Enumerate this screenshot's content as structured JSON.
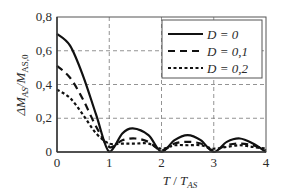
{
  "chart_data": {
    "type": "line",
    "title": "",
    "xlabel": "T / T_AS",
    "ylabel": "ΔM_AS / M_AS,0",
    "xlim": [
      0,
      4
    ],
    "ylim": [
      0,
      0.8
    ],
    "x_ticks": [
      "0",
      "1",
      "2",
      "3",
      "4"
    ],
    "y_ticks": [
      "0",
      "0,2",
      "0,4",
      "0,6",
      "0,8"
    ],
    "grid": true,
    "legend_position": "upper right",
    "series": [
      {
        "name": "D = 0",
        "style": "solid",
        "x": [
          0,
          0.25,
          0.5,
          0.75,
          1.0,
          1.25,
          1.45,
          1.75,
          2.0,
          2.25,
          2.5,
          2.75,
          3.0,
          3.25,
          3.5,
          3.75,
          4.0
        ],
        "y": [
          0.7,
          0.63,
          0.45,
          0.22,
          0.0,
          0.11,
          0.14,
          0.1,
          0.0,
          0.07,
          0.1,
          0.07,
          0.0,
          0.06,
          0.08,
          0.05,
          0.0
        ]
      },
      {
        "name": "D = 0,1",
        "style": "dashed",
        "x": [
          0,
          0.25,
          0.5,
          0.75,
          1.0,
          1.25,
          1.5,
          1.75,
          2.0,
          2.25,
          2.5,
          2.75,
          3.0,
          3.25,
          3.5,
          3.75,
          4.0
        ],
        "y": [
          0.51,
          0.44,
          0.31,
          0.15,
          0.03,
          0.07,
          0.08,
          0.06,
          0.01,
          0.05,
          0.06,
          0.05,
          0.01,
          0.04,
          0.05,
          0.04,
          0.01
        ]
      },
      {
        "name": "D = 0,2",
        "style": "dotted",
        "x": [
          0,
          0.25,
          0.5,
          0.75,
          1.0,
          1.25,
          1.5,
          1.75,
          2.0,
          2.25,
          2.5,
          2.75,
          3.0,
          3.25,
          3.5,
          3.75,
          4.0
        ],
        "y": [
          0.37,
          0.32,
          0.22,
          0.11,
          0.05,
          0.05,
          0.05,
          0.05,
          0.02,
          0.04,
          0.04,
          0.04,
          0.02,
          0.03,
          0.04,
          0.03,
          0.02
        ]
      }
    ]
  },
  "legend": {
    "items": [
      {
        "label": "D = 0"
      },
      {
        "label": "D = 0,1"
      },
      {
        "label": "D = 0,2"
      }
    ]
  },
  "axes": {
    "x_label_main": "T",
    "x_label_sep": " / ",
    "x_label_den": "T",
    "x_label_sub": "AS",
    "y_label_prefix": "ΔM",
    "y_label_sub1": "AS",
    "y_label_sep": "/M",
    "y_label_sub2": "AS,0"
  }
}
